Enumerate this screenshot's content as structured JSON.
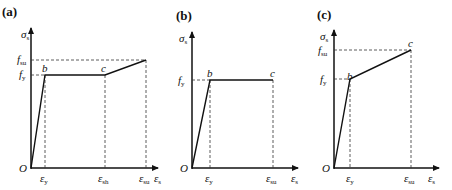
{
  "panels": [
    {
      "id": "a",
      "label": "(a)",
      "y_axis_label": "σ",
      "y_axis_sub": "s",
      "x_axis_label": "ε",
      "x_axis_sub": "s",
      "origin": "O",
      "y_ticks": [
        {
          "main": "f",
          "sub": "su"
        },
        {
          "main": "f",
          "sub": "y"
        }
      ],
      "x_ticks": [
        {
          "main": "ε",
          "sub": "y"
        },
        {
          "main": "ε",
          "sub": "sh"
        },
        {
          "main": "ε",
          "sub": "su"
        }
      ],
      "points": [
        "b",
        "c"
      ]
    },
    {
      "id": "b",
      "label": "(b)",
      "y_axis_label": "σ",
      "y_axis_sub": "s",
      "x_axis_label": "ε",
      "x_axis_sub": "s",
      "origin": "O",
      "y_ticks": [
        {
          "main": "f",
          "sub": "y"
        }
      ],
      "x_ticks": [
        {
          "main": "ε",
          "sub": "y"
        },
        {
          "main": "ε",
          "sub": "su"
        }
      ],
      "points": [
        "b",
        "c"
      ]
    },
    {
      "id": "c",
      "label": "(c)",
      "y_axis_label": "σ",
      "y_axis_sub": "s",
      "x_axis_label": "ε",
      "x_axis_sub": "s",
      "origin": "O",
      "y_ticks": [
        {
          "main": "f",
          "sub": "su"
        },
        {
          "main": "f",
          "sub": "y"
        }
      ],
      "x_ticks": [
        {
          "main": "ε",
          "sub": "y"
        },
        {
          "main": "ε",
          "sub": "su"
        }
      ],
      "points": [
        "b",
        "c"
      ]
    }
  ],
  "colors": {
    "line": "#111111",
    "dash": "#333333"
  }
}
